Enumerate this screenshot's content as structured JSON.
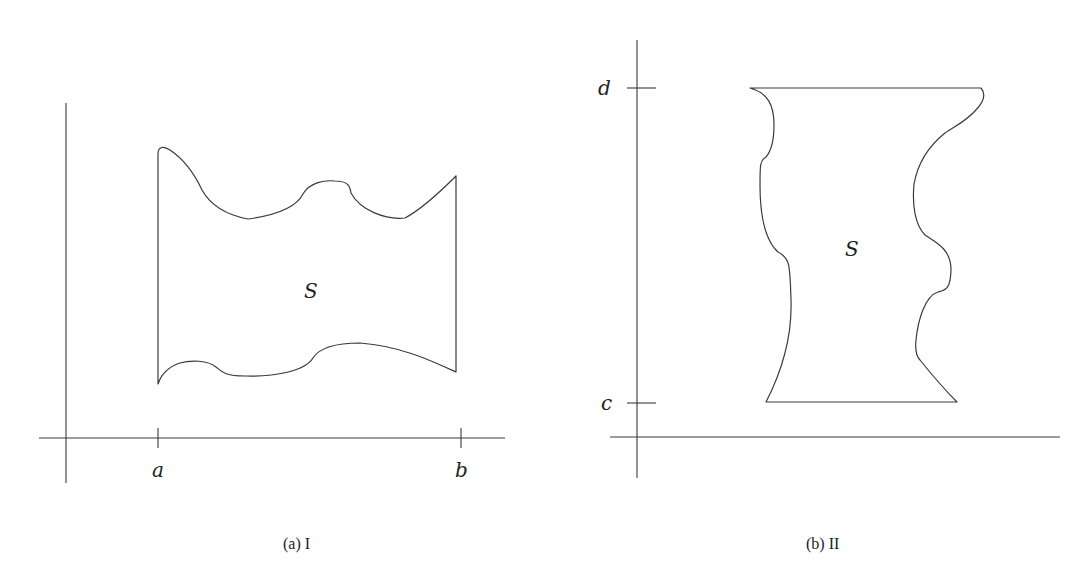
{
  "figure": {
    "panels": [
      {
        "id": "a",
        "caption": "(a) I",
        "region_label": "S",
        "x_ticks": [
          {
            "label": "a"
          },
          {
            "label": "b"
          }
        ],
        "description": "Region S bounded between x = a and x = b by a lower and an upper curve"
      },
      {
        "id": "b",
        "caption": "(b) II",
        "region_label": "S",
        "y_ticks": [
          {
            "label": "d"
          },
          {
            "label": "c"
          }
        ],
        "description": "Region S bounded between y = c and y = d by a left and a right curve"
      }
    ]
  },
  "colors": {
    "background": "#ffffff",
    "stroke": "#3a3a3a",
    "text": "#222222"
  }
}
